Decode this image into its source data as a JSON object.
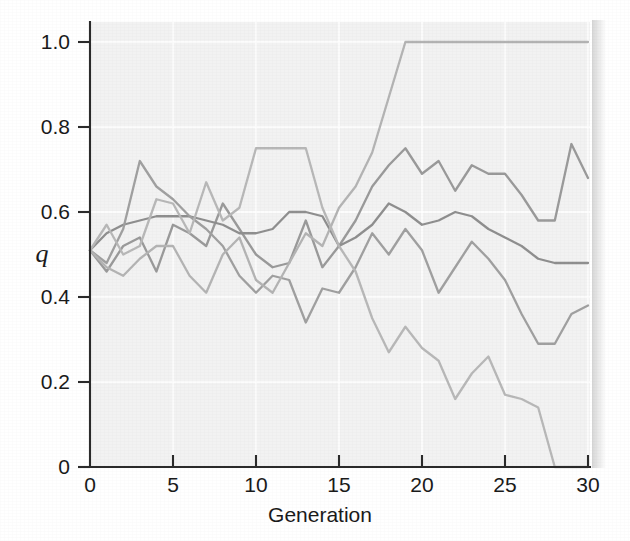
{
  "figure": {
    "background_color": "#ffffff",
    "plot_background_color": "#f2f2f2",
    "grid_color": "#ffffff",
    "axis_color": "#2b2b2b"
  },
  "axes": {
    "y_label": "q",
    "x_label": "Generation",
    "y_ticks": [
      "0",
      "0.2",
      "0.4",
      "0.6",
      "0.8",
      "1.0"
    ],
    "y_tick_values": [
      0,
      0.2,
      0.4,
      0.6,
      0.8,
      1.0
    ],
    "x_ticks": [
      "0",
      "5",
      "10",
      "15",
      "20",
      "25",
      "30"
    ],
    "x_tick_values": [
      0,
      5,
      10,
      15,
      20,
      25,
      30
    ]
  },
  "chart_data": {
    "type": "line",
    "title": "",
    "xlabel": "Generation",
    "ylabel": "q",
    "xlim": [
      0,
      30
    ],
    "ylim": [
      0,
      1.0
    ],
    "grid": true,
    "legend": "none",
    "x": [
      0,
      1,
      2,
      3,
      4,
      5,
      6,
      7,
      8,
      9,
      10,
      11,
      12,
      13,
      14,
      15,
      16,
      17,
      18,
      19,
      20,
      21,
      22,
      23,
      24,
      25,
      26,
      27,
      28,
      29,
      30
    ],
    "series": [
      {
        "name": "replicate-1",
        "color": "#9a9a9a",
        "values": [
          0.51,
          0.46,
          0.52,
          0.54,
          0.46,
          0.57,
          0.55,
          0.52,
          0.62,
          0.56,
          0.5,
          0.47,
          0.48,
          0.58,
          0.47,
          0.52,
          0.58,
          0.66,
          0.71,
          0.75,
          0.69,
          0.72,
          0.65,
          0.71,
          0.69,
          0.69,
          0.64,
          0.58,
          0.58,
          0.76,
          0.68
        ]
      },
      {
        "name": "replicate-2",
        "color": "#8f8f8f",
        "values": [
          0.51,
          0.55,
          0.57,
          0.58,
          0.59,
          0.59,
          0.59,
          0.58,
          0.57,
          0.55,
          0.55,
          0.56,
          0.6,
          0.6,
          0.59,
          0.52,
          0.54,
          0.57,
          0.62,
          0.6,
          0.57,
          0.58,
          0.6,
          0.59,
          0.56,
          0.54,
          0.52,
          0.49,
          0.48,
          0.48,
          0.48
        ]
      },
      {
        "name": "replicate-3",
        "color": "#a0a0a0",
        "values": [
          0.51,
          0.48,
          0.56,
          0.72,
          0.66,
          0.63,
          0.59,
          0.56,
          0.52,
          0.45,
          0.41,
          0.45,
          0.44,
          0.34,
          0.42,
          0.41,
          0.47,
          0.55,
          0.5,
          0.56,
          0.51,
          0.41,
          0.47,
          0.53,
          0.49,
          0.44,
          0.36,
          0.29,
          0.29,
          0.36,
          0.38
        ]
      },
      {
        "name": "replicate-4",
        "color": "#b4b4b4",
        "values": [
          0.51,
          0.47,
          0.45,
          0.49,
          0.52,
          0.52,
          0.45,
          0.41,
          0.5,
          0.54,
          0.44,
          0.41,
          0.48,
          0.55,
          0.52,
          0.61,
          0.66,
          0.74,
          0.87,
          1.0,
          1.0,
          1.0,
          1.0,
          1.0,
          1.0,
          1.0,
          1.0,
          1.0,
          1.0,
          1.0,
          1.0
        ]
      },
      {
        "name": "replicate-5",
        "color": "#b8b8b8",
        "values": [
          0.51,
          0.57,
          0.5,
          0.52,
          0.63,
          0.62,
          0.55,
          0.67,
          0.58,
          0.61,
          0.75,
          0.75,
          0.75,
          0.75,
          0.61,
          0.52,
          0.46,
          0.35,
          0.27,
          0.33,
          0.28,
          0.25,
          0.16,
          0.22,
          0.26,
          0.17,
          0.16,
          0.14,
          0.0,
          0.0,
          0.0
        ]
      }
    ]
  }
}
